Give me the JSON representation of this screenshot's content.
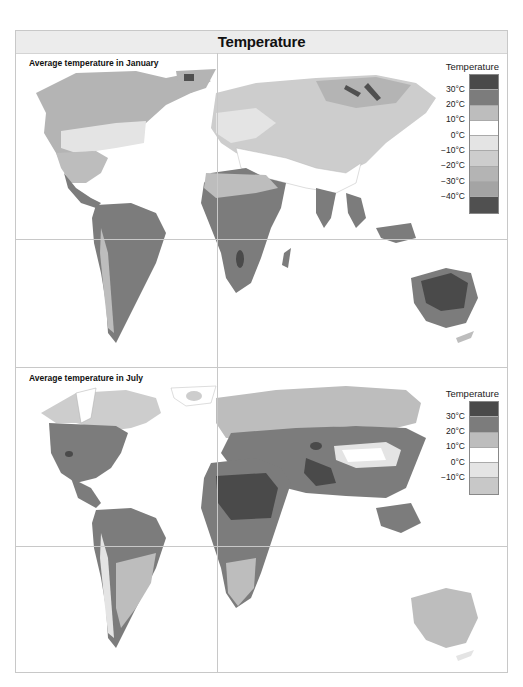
{
  "header": {
    "title": "Temperature"
  },
  "panels": {
    "january": {
      "title": "Average temperature in January",
      "legend": {
        "title": "Temperature",
        "swatches": [
          "#4a4a4a",
          "#7c7c7c",
          "#bdbdbd",
          "#ffffff",
          "#e4e4e4",
          "#cdcdcd",
          "#b4b4b4",
          "#a4a4a4",
          "#505050"
        ],
        "labels": [
          "30°C",
          "20°C",
          "10°C",
          "0°C",
          "−10°C",
          "−20°C",
          "−30°C",
          "−40°C"
        ]
      }
    },
    "july": {
      "title": "Average temperature in July",
      "legend": {
        "title": "Temperature",
        "swatches": [
          "#4a4a4a",
          "#7c7c7c",
          "#bdbdbd",
          "#ffffff",
          "#e4e4e4",
          "#c8c8c8"
        ],
        "labels": [
          "30°C",
          "20°C",
          "10°C",
          "0°C",
          "−10°C"
        ]
      }
    }
  },
  "colors": {
    "ocean": "#ffffff",
    "frame_border": "#c8c8c8",
    "header_bg": "#ececec"
  }
}
